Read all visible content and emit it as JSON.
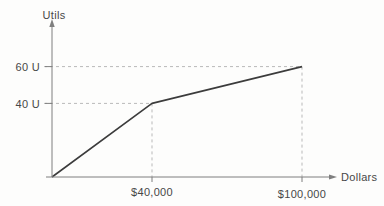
{
  "chart_data": {
    "type": "line",
    "title": "",
    "xlabel": "Dollars",
    "ylabel": "Utils",
    "points": [
      {
        "dollars": 0,
        "utils": 0
      },
      {
        "dollars": 40000,
        "utils": 40
      },
      {
        "dollars": 100000,
        "utils": 60
      }
    ],
    "x_ticks": [
      {
        "value": 40000,
        "label": "$40,000"
      },
      {
        "value": 100000,
        "label": "$100,000"
      }
    ],
    "y_ticks": [
      {
        "value": 40,
        "label": "40 U"
      },
      {
        "value": 60,
        "label": "60 U"
      }
    ],
    "xlim": [
      0,
      112000
    ],
    "ylim": [
      0,
      84
    ],
    "grid": "dashed-reference-lines",
    "legend_position": "none",
    "colors": {
      "line": "#3c3c3c",
      "axis": "#7f7f7f",
      "grid": "#b9b9b9",
      "text": "#474747",
      "background": "#fdfdfc"
    }
  }
}
